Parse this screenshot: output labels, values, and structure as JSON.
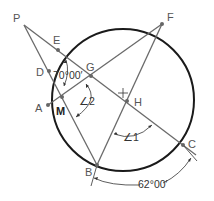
{
  "diagram": {
    "type": "circle-secant-chord geometry",
    "circle": {
      "cx": 123,
      "cy": 100,
      "r": 71
    },
    "center_mark": {
      "x": 123,
      "y": 93
    },
    "points": {
      "P": {
        "label": "P",
        "x": 24,
        "y": 25
      },
      "E": {
        "label": "E",
        "x": 58,
        "y": 50
      },
      "D": {
        "label": "D",
        "x": 49,
        "y": 71
      },
      "G": {
        "label": "G",
        "x": 91,
        "y": 76
      },
      "A": {
        "label": "A",
        "x": 48,
        "y": 105
      },
      "M": {
        "label": "M",
        "x": 62,
        "y": 97
      },
      "F": {
        "label": "F",
        "x": 162,
        "y": 24
      },
      "H": {
        "label": "H",
        "x": 127,
        "y": 101
      },
      "B": {
        "label": "B",
        "x": 97,
        "y": 165
      },
      "C": {
        "label": "C",
        "x": 183,
        "y": 145
      }
    },
    "angle_labels": {
      "angle_EGD": "70°00′",
      "angle_2": "∠2",
      "angle_1": "∠1",
      "arc_BC": "62°00′"
    }
  }
}
